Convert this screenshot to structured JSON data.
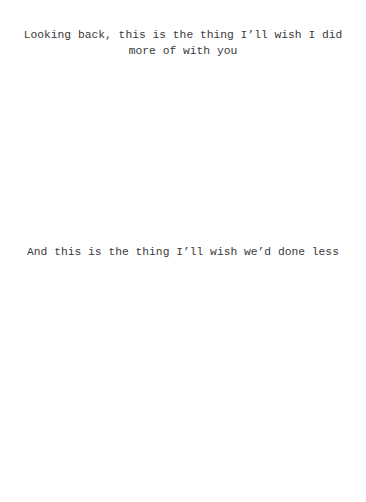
{
  "captions": {
    "top": "Looking back, this is the thing I’ll wish I did more of with you",
    "bottom": "And this is the thing I’ll wish we’d done less"
  },
  "colors": {
    "background": "#ffffff",
    "text": "#3a3a3a"
  }
}
